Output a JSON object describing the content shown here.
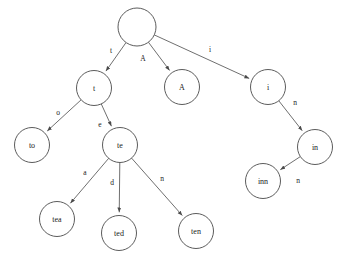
{
  "diagram": {
    "type": "trie-tree",
    "canvas": {
      "width": 343,
      "height": 262,
      "background": "#ffffff"
    },
    "style": {
      "node_stroke": "#4a4a4a",
      "node_fill": "#ffffff",
      "edge_stroke": "#4a4a4a",
      "text_color": "#1a1a1a",
      "node_radius": 17.5,
      "root_radius": 19
    },
    "nodes": [
      {
        "id": "root",
        "label": "",
        "cx": 137,
        "cy": 27,
        "r": 19
      },
      {
        "id": "t",
        "label": "t",
        "cx": 94,
        "cy": 88,
        "r": 17.5
      },
      {
        "id": "A",
        "label": "A",
        "cx": 182,
        "cy": 87,
        "r": 17.5
      },
      {
        "id": "i",
        "label": "i",
        "cx": 268,
        "cy": 87,
        "r": 17.5
      },
      {
        "id": "to",
        "label": "to",
        "cx": 32,
        "cy": 145,
        "r": 17.5
      },
      {
        "id": "te",
        "label": "te",
        "cx": 120,
        "cy": 145,
        "r": 17.5
      },
      {
        "id": "in",
        "label": "in",
        "cx": 315,
        "cy": 147,
        "r": 17.5
      },
      {
        "id": "inn",
        "label": "inn",
        "cx": 263,
        "cy": 181,
        "r": 17.5
      },
      {
        "id": "tea",
        "label": "tea",
        "cx": 57,
        "cy": 219,
        "r": 17.5
      },
      {
        "id": "ted",
        "label": "ted",
        "cx": 119,
        "cy": 233,
        "r": 17.5
      },
      {
        "id": "ten",
        "label": "ten",
        "cx": 196,
        "cy": 231,
        "r": 17.5
      }
    ],
    "edges": [
      {
        "from": "root",
        "to": "t",
        "label": "t",
        "lx": 111,
        "ly": 50
      },
      {
        "from": "root",
        "to": "A",
        "label": "A",
        "lx": 143,
        "ly": 58
      },
      {
        "from": "root",
        "to": "i",
        "label": "i",
        "lx": 210,
        "ly": 49
      },
      {
        "from": "t",
        "to": "to",
        "label": "o",
        "lx": 58,
        "ly": 112
      },
      {
        "from": "t",
        "to": "te",
        "label": "e",
        "lx": 100,
        "ly": 124
      },
      {
        "from": "te",
        "to": "tea",
        "label": "a",
        "lx": 85,
        "ly": 172
      },
      {
        "from": "te",
        "to": "ted",
        "label": "d",
        "lx": 112,
        "ly": 182
      },
      {
        "from": "te",
        "to": "ten",
        "label": "n",
        "lx": 162,
        "ly": 178
      },
      {
        "from": "i",
        "to": "in",
        "label": "n",
        "lx": 295,
        "ly": 102
      },
      {
        "from": "in",
        "to": "inn",
        "label": "n",
        "lx": 298,
        "ly": 180
      }
    ]
  }
}
